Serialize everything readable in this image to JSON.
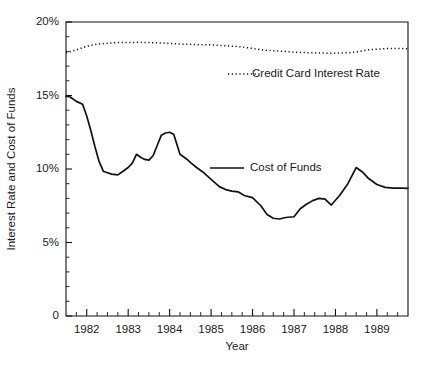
{
  "chart_data": {
    "type": "line",
    "title": "",
    "xlabel": "Year",
    "ylabel": "Interest Rate and Cost of Funds",
    "xlim": [
      1981.5,
      1989.75
    ],
    "ylim": [
      0,
      20
    ],
    "grid": false,
    "legend_position": "inside-right",
    "y_ticks": [
      0,
      5,
      10,
      15,
      20
    ],
    "y_tick_labels": [
      "0",
      "5%",
      "10%",
      "15%",
      "20%"
    ],
    "y_minor_tick_step": 1,
    "x_ticks": [
      1982,
      1983,
      1984,
      1985,
      1986,
      1987,
      1988,
      1989
    ],
    "x_tick_labels": [
      "1982",
      "1983",
      "1984",
      "1985",
      "1986",
      "1987",
      "1988",
      "1989"
    ],
    "x_minor_tick_step": 0.25,
    "series": [
      {
        "name": "Credit Card Interest Rate",
        "style": "dotted",
        "color": "#111111",
        "x": [
          1981.5,
          1981.75,
          1982.0,
          1982.25,
          1982.5,
          1982.75,
          1983.0,
          1983.25,
          1983.5,
          1983.75,
          1984.0,
          1984.25,
          1984.5,
          1984.75,
          1985.0,
          1985.25,
          1985.5,
          1985.75,
          1986.0,
          1986.25,
          1986.5,
          1986.75,
          1987.0,
          1987.25,
          1987.5,
          1987.75,
          1988.0,
          1988.25,
          1988.5,
          1988.75,
          1989.0,
          1989.25,
          1989.5,
          1989.75
        ],
        "values": [
          17.9,
          18.1,
          18.35,
          18.5,
          18.55,
          18.6,
          18.6,
          18.62,
          18.6,
          18.58,
          18.55,
          18.5,
          18.48,
          18.45,
          18.45,
          18.4,
          18.35,
          18.3,
          18.2,
          18.1,
          18.05,
          18.0,
          17.95,
          17.92,
          17.9,
          17.88,
          17.88,
          17.9,
          17.95,
          18.1,
          18.15,
          18.2,
          18.2,
          18.18
        ]
      },
      {
        "name": "Cost of Funds",
        "style": "solid",
        "color": "#111111",
        "x": [
          1981.5,
          1981.6,
          1981.75,
          1981.9,
          1982.0,
          1982.1,
          1982.2,
          1982.3,
          1982.4,
          1982.5,
          1982.6,
          1982.75,
          1982.85,
          1983.0,
          1983.1,
          1983.2,
          1983.3,
          1983.4,
          1983.5,
          1983.6,
          1983.7,
          1983.8,
          1983.9,
          1984.0,
          1984.1,
          1984.25,
          1984.4,
          1984.5,
          1984.65,
          1984.8,
          1985.0,
          1985.2,
          1985.35,
          1985.5,
          1985.65,
          1985.8,
          1986.0,
          1986.2,
          1986.35,
          1986.5,
          1986.65,
          1986.8,
          1987.0,
          1987.15,
          1987.3,
          1987.45,
          1987.6,
          1987.75,
          1987.9,
          1988.1,
          1988.3,
          1988.5,
          1988.65,
          1988.8,
          1989.0,
          1989.2,
          1989.4,
          1989.6,
          1989.75
        ],
        "values": [
          14.95,
          14.9,
          14.6,
          14.4,
          13.6,
          12.6,
          11.5,
          10.5,
          9.85,
          9.75,
          9.65,
          9.6,
          9.8,
          10.1,
          10.4,
          11.0,
          10.8,
          10.65,
          10.6,
          10.9,
          11.6,
          12.3,
          12.45,
          12.5,
          12.35,
          11.0,
          10.7,
          10.45,
          10.1,
          9.8,
          9.3,
          8.8,
          8.6,
          8.5,
          8.45,
          8.2,
          8.05,
          7.5,
          6.9,
          6.65,
          6.6,
          6.7,
          6.75,
          7.3,
          7.6,
          7.85,
          8.0,
          7.95,
          7.55,
          8.2,
          9.0,
          10.1,
          9.8,
          9.35,
          8.95,
          8.75,
          8.7,
          8.7,
          8.68
        ]
      }
    ],
    "legend": [
      {
        "label": "Credit Card Interest Rate",
        "style": "dotted"
      },
      {
        "label": "Cost of Funds",
        "style": "solid"
      }
    ]
  },
  "axes": {
    "y_label": "Interest Rate and Cost of Funds",
    "x_label": "Year",
    "y_tick_labels": [
      "20%",
      "15%",
      "10%",
      "5%",
      "0"
    ],
    "x_tick_labels": [
      "1982",
      "1983",
      "1984",
      "1985",
      "1986",
      "1987",
      "1988",
      "1989"
    ]
  },
  "legend": {
    "credit_card_label": "Credit Card Interest Rate",
    "cost_of_funds_label": "Cost of Funds"
  },
  "colors": {
    "ink": "#111111",
    "background": "#ffffff"
  }
}
